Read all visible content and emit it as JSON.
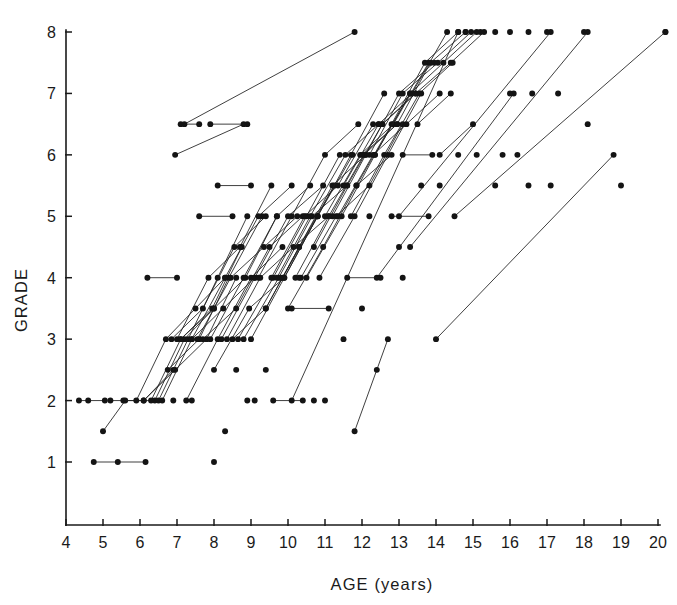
{
  "chart_data": {
    "type": "scatter",
    "title": "",
    "subtitle": "",
    "xlabel": "AGE (years)",
    "ylabel": "GRADE",
    "xlim": [
      4,
      20
    ],
    "ylim": [
      0.6,
      8.2
    ],
    "xticks": [
      4,
      5,
      6,
      7,
      8,
      9,
      10,
      11,
      12,
      13,
      14,
      15,
      16,
      17,
      18,
      19,
      20
    ],
    "yticks": [
      1,
      2,
      3,
      4,
      5,
      6,
      7,
      8
    ],
    "xtick_labels": [
      "4",
      "5",
      "6",
      "7",
      "8",
      "9",
      "10",
      "11",
      "12",
      "13",
      "14",
      "15",
      "16",
      "17",
      "18",
      "19",
      "20"
    ],
    "ytick_labels": [
      "1",
      "2",
      "3",
      "4",
      "5",
      "6",
      "7",
      "8"
    ],
    "grid": false,
    "legend": false,
    "legend_position": "none",
    "marker": "filled-circle",
    "marker_size": 4,
    "line_style": "solid",
    "series": [
      {
        "name": "s01",
        "x": [
          4.35,
          4.6,
          5.05
        ],
        "y": [
          2,
          2,
          2
        ]
      },
      {
        "name": "s02",
        "x": [
          4.75,
          5.4,
          6.15
        ],
        "y": [
          1,
          1,
          1
        ]
      },
      {
        "name": "s03",
        "x": [
          5.0,
          5.6
        ],
        "y": [
          1.5,
          2
        ]
      },
      {
        "name": "s04",
        "x": [
          5.2,
          6.1,
          6.9
        ],
        "y": [
          2,
          2,
          2.5
        ]
      },
      {
        "name": "s05",
        "x": [
          5.55,
          6.4,
          7.2,
          8.0
        ],
        "y": [
          2,
          2,
          3,
          3.5
        ]
      },
      {
        "name": "s06",
        "x": [
          5.9,
          6.7,
          7.5,
          8.3
        ],
        "y": [
          2,
          3,
          3.5,
          4
        ]
      },
      {
        "name": "s07",
        "x": [
          6.1,
          6.95,
          7.8,
          8.6
        ],
        "y": [
          2,
          2.5,
          3,
          4
        ]
      },
      {
        "name": "s08",
        "x": [
          6.3,
          7.1,
          7.95,
          8.75
        ],
        "y": [
          2,
          3,
          3.5,
          4.5
        ]
      },
      {
        "name": "s09",
        "x": [
          6.5,
          7.3,
          8.1,
          8.9
        ],
        "y": [
          2,
          3,
          4,
          5
        ]
      },
      {
        "name": "s10",
        "x": [
          6.6,
          7.4,
          8.25,
          9.1
        ],
        "y": [
          2,
          3,
          3.5,
          4
        ]
      },
      {
        "name": "s11",
        "x": [
          6.75,
          7.6,
          8.4,
          9.3
        ],
        "y": [
          2.5,
          3,
          4,
          5
        ]
      },
      {
        "name": "s12",
        "x": [
          6.85,
          7.7,
          8.55,
          9.4
        ],
        "y": [
          3,
          3.5,
          4.5,
          5
        ]
      },
      {
        "name": "s13",
        "x": [
          7.0,
          7.85,
          8.7,
          9.55
        ],
        "y": [
          3,
          4,
          4.5,
          5.5
        ]
      },
      {
        "name": "s14",
        "x": [
          7.1,
          8.0,
          8.85,
          9.7
        ],
        "y": [
          3,
          3.5,
          4,
          5
        ]
      },
      {
        "name": "s15",
        "x": [
          7.25,
          8.1,
          9.0,
          9.85
        ],
        "y": [
          2,
          3,
          4,
          4.5
        ]
      },
      {
        "name": "s16",
        "x": [
          6.95,
          8.8
        ],
        "y": [
          6,
          6.5
        ]
      },
      {
        "name": "s17",
        "x": [
          7.4,
          8.3,
          9.2,
          10.1
        ],
        "y": [
          3,
          4,
          5,
          5.5
        ]
      },
      {
        "name": "s18",
        "x": [
          7.55,
          8.45,
          9.35,
          10.25
        ],
        "y": [
          3,
          4,
          4.5,
          5
        ]
      },
      {
        "name": "s19",
        "x": [
          7.7,
          8.6,
          9.5,
          10.4
        ],
        "y": [
          3,
          3.5,
          4.5,
          5
        ]
      },
      {
        "name": "s20",
        "x": [
          7.9,
          8.8,
          9.7,
          10.6
        ],
        "y": [
          3,
          4,
          5,
          5.5
        ]
      },
      {
        "name": "s21",
        "x": [
          8.0,
          8.95,
          9.9,
          10.8
        ],
        "y": [
          2.5,
          3.5,
          4,
          5
        ]
      },
      {
        "name": "s22",
        "x": [
          8.2,
          9.1,
          10.0,
          10.95
        ],
        "y": [
          3,
          4,
          5,
          5.5
        ]
      },
      {
        "name": "s23",
        "x": [
          8.35,
          9.25,
          10.15,
          11.1
        ],
        "y": [
          3,
          4,
          4.5,
          5
        ]
      },
      {
        "name": "s24",
        "x": [
          8.5,
          9.4,
          10.3,
          11.25
        ],
        "y": [
          3,
          3.5,
          4.5,
          5.5
        ]
      },
      {
        "name": "s25",
        "x": [
          8.65,
          9.6,
          10.5,
          11.4
        ],
        "y": [
          3,
          4,
          5,
          6
        ]
      },
      {
        "name": "s26",
        "x": [
          8.8,
          9.75,
          10.65,
          11.6
        ],
        "y": [
          3,
          4,
          5,
          5.5
        ]
      },
      {
        "name": "s27",
        "x": [
          9.0,
          9.9,
          10.8,
          11.75
        ],
        "y": [
          3,
          4,
          5,
          6
        ]
      },
      {
        "name": "s28",
        "x": [
          7.1,
          7.6
        ],
        "y": [
          6.5,
          6.5
        ]
      },
      {
        "name": "s29",
        "x": [
          7.9,
          8.9
        ],
        "y": [
          6.5,
          6.5
        ]
      },
      {
        "name": "s30",
        "x": [
          8.1,
          9.0
        ],
        "y": [
          5.5,
          5.5
        ]
      },
      {
        "name": "s31",
        "x": [
          7.6,
          8.5
        ],
        "y": [
          5,
          5
        ]
      },
      {
        "name": "s32",
        "x": [
          9.2,
          10.1,
          11.0,
          11.9
        ],
        "y": [
          4,
          5,
          6,
          6.5
        ]
      },
      {
        "name": "s33",
        "x": [
          9.4,
          10.3,
          11.2,
          12.1
        ],
        "y": [
          3.5,
          4.5,
          5.5,
          6
        ]
      },
      {
        "name": "s34",
        "x": [
          9.55,
          10.45,
          11.35,
          12.3
        ],
        "y": [
          4,
          5,
          5.5,
          6.5
        ]
      },
      {
        "name": "s35",
        "x": [
          9.7,
          10.6,
          11.55,
          12.45
        ],
        "y": [
          4,
          5,
          6,
          6.5
        ]
      },
      {
        "name": "s36",
        "x": [
          9.85,
          10.8,
          11.7,
          12.6
        ],
        "y": [
          4,
          5,
          6,
          7
        ]
      },
      {
        "name": "s37",
        "x": [
          10.0,
          10.95,
          11.85,
          12.8
        ],
        "y": [
          3.5,
          4.5,
          5.5,
          6
        ]
      },
      {
        "name": "s38",
        "x": [
          10.2,
          11.1,
          12.05,
          12.95
        ],
        "y": [
          4,
          5,
          6,
          6.5
        ]
      },
      {
        "name": "s39",
        "x": [
          10.35,
          11.3,
          12.2,
          13.1
        ],
        "y": [
          4,
          5,
          5.5,
          6.5
        ]
      },
      {
        "name": "s40",
        "x": [
          10.5,
          11.45,
          12.35,
          13.3
        ],
        "y": [
          4,
          5,
          6,
          7
        ]
      },
      {
        "name": "s41",
        "x": [
          10.7,
          11.6,
          12.55,
          13.45
        ],
        "y": [
          4.5,
          5.5,
          6.5,
          7
        ]
      },
      {
        "name": "s42",
        "x": [
          10.85,
          11.8,
          12.7,
          13.6
        ],
        "y": [
          4,
          5,
          6,
          7
        ]
      },
      {
        "name": "s43",
        "x": [
          11.0,
          11.95,
          12.85,
          13.8
        ],
        "y": [
          5,
          6,
          6.5,
          7.5
        ]
      },
      {
        "name": "s44",
        "x": [
          11.2,
          12.1,
          13.0,
          13.95
        ],
        "y": [
          5,
          6,
          7,
          7.5
        ]
      },
      {
        "name": "s45",
        "x": [
          11.35,
          12.3,
          13.2,
          14.1
        ],
        "y": [
          5,
          6,
          6.5,
          7
        ]
      },
      {
        "name": "s46",
        "x": [
          11.5,
          12.45,
          13.35,
          14.3
        ],
        "y": [
          5.5,
          6.5,
          7,
          8
        ]
      },
      {
        "name": "s47",
        "x": [
          11.7,
          12.6,
          13.55,
          14.45
        ],
        "y": [
          5,
          6,
          7,
          7.5
        ]
      },
      {
        "name": "s48",
        "x": [
          11.85,
          12.8,
          13.7,
          14.6
        ],
        "y": [
          5.5,
          6.5,
          7.5,
          8
        ]
      },
      {
        "name": "s49",
        "x": [
          12.0,
          12.95,
          13.85,
          14.8
        ],
        "y": [
          6,
          6.5,
          7.5,
          8
        ]
      },
      {
        "name": "s50",
        "x": [
          12.2,
          13.1,
          14.05,
          14.95
        ],
        "y": [
          6,
          7,
          7.5,
          8
        ]
      },
      {
        "name": "s51",
        "x": [
          12.35,
          13.3,
          14.2,
          15.1
        ],
        "y": [
          6,
          7,
          7.5,
          8
        ]
      },
      {
        "name": "s52",
        "x": [
          12.55,
          13.45,
          14.4,
          15.3
        ],
        "y": [
          6.5,
          7,
          7.5,
          8
        ]
      },
      {
        "name": "s53",
        "x": [
          9.6,
          10.4
        ],
        "y": [
          2,
          2
        ]
      },
      {
        "name": "s54",
        "x": [
          10.1,
          11.1
        ],
        "y": [
          3.5,
          3.5
        ]
      },
      {
        "name": "s55",
        "x": [
          11.8,
          12.7
        ],
        "y": [
          1.5,
          3
        ]
      },
      {
        "name": "s56",
        "x": [
          7.2,
          11.8
        ],
        "y": [
          6.5,
          8
        ]
      },
      {
        "name": "s57",
        "x": [
          10.1,
          14.6
        ],
        "y": [
          2,
          8
        ]
      },
      {
        "name": "s58",
        "x": [
          12.4,
          16.1
        ],
        "y": [
          4,
          7
        ]
      },
      {
        "name": "s59",
        "x": [
          13.0,
          17.1
        ],
        "y": [
          5,
          8
        ]
      },
      {
        "name": "s60",
        "x": [
          13.3,
          18.1
        ],
        "y": [
          4.5,
          8
        ]
      },
      {
        "name": "s61",
        "x": [
          14.0,
          18.8
        ],
        "y": [
          3,
          6
        ]
      },
      {
        "name": "s62",
        "x": [
          14.5,
          20.2
        ],
        "y": [
          5,
          8
        ]
      },
      {
        "name": "s63",
        "x": [
          6.2,
          7.0
        ],
        "y": [
          4,
          4
        ]
      },
      {
        "name": "s64",
        "x": [
          11.6,
          12.5
        ],
        "y": [
          4,
          4
        ]
      },
      {
        "name": "s65",
        "x": [
          13.1,
          13.9
        ],
        "y": [
          6,
          6
        ]
      },
      {
        "name": "s66",
        "x": [
          12.8,
          13.8
        ],
        "y": [
          5,
          5
        ]
      },
      {
        "name": "s67",
        "x": [
          13.5,
          14.4
        ],
        "y": [
          6.5,
          7
        ]
      },
      {
        "name": "s68",
        "x": [
          14.1,
          15.0
        ],
        "y": [
          6,
          6.5
        ]
      }
    ],
    "isolated_points": [
      {
        "x": 8.0,
        "y": 1.0
      },
      {
        "x": 8.3,
        "y": 1.5
      },
      {
        "x": 9.4,
        "y": 2.5
      },
      {
        "x": 10.7,
        "y": 2.0
      },
      {
        "x": 12.4,
        "y": 2.5
      },
      {
        "x": 11.5,
        "y": 3.0
      },
      {
        "x": 12.0,
        "y": 3.5
      },
      {
        "x": 13.1,
        "y": 4.0
      },
      {
        "x": 12.2,
        "y": 5.0
      },
      {
        "x": 13.0,
        "y": 4.5
      },
      {
        "x": 13.6,
        "y": 5.5
      },
      {
        "x": 14.1,
        "y": 5.5
      },
      {
        "x": 14.6,
        "y": 6.0
      },
      {
        "x": 15.1,
        "y": 6.0
      },
      {
        "x": 15.8,
        "y": 6.0
      },
      {
        "x": 16.2,
        "y": 6.0
      },
      {
        "x": 15.6,
        "y": 5.5
      },
      {
        "x": 16.5,
        "y": 5.5
      },
      {
        "x": 17.1,
        "y": 5.5
      },
      {
        "x": 16.0,
        "y": 7.0
      },
      {
        "x": 16.6,
        "y": 7.0
      },
      {
        "x": 17.3,
        "y": 7.0
      },
      {
        "x": 18.1,
        "y": 6.5
      },
      {
        "x": 14.8,
        "y": 8.0
      },
      {
        "x": 15.2,
        "y": 8.0
      },
      {
        "x": 15.6,
        "y": 8.0
      },
      {
        "x": 16.0,
        "y": 8.0
      },
      {
        "x": 16.5,
        "y": 8.0
      },
      {
        "x": 17.0,
        "y": 8.0
      },
      {
        "x": 18.0,
        "y": 8.0
      },
      {
        "x": 20.2,
        "y": 8.0
      },
      {
        "x": 19.0,
        "y": 5.5
      },
      {
        "x": 9.8,
        "y": 4.0
      },
      {
        "x": 10.3,
        "y": 4.0
      },
      {
        "x": 8.9,
        "y": 2.0
      },
      {
        "x": 9.1,
        "y": 2.0
      },
      {
        "x": 7.4,
        "y": 2.0
      },
      {
        "x": 6.9,
        "y": 2.0
      },
      {
        "x": 8.6,
        "y": 2.5
      },
      {
        "x": 11.0,
        "y": 2.0
      }
    ]
  },
  "axes": {
    "x_axis_name": "age-axis",
    "y_axis_name": "grade-axis"
  }
}
